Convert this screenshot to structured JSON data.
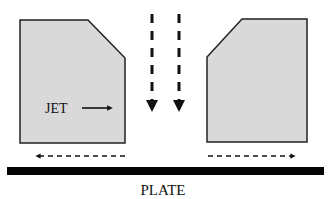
{
  "diagram": {
    "jet_label": "JET",
    "plate_label": "PLATE",
    "colors": {
      "block_fill": "#d9d9d9",
      "block_stroke": "#222222",
      "arrow": "#111111",
      "plate": "#050505"
    }
  }
}
